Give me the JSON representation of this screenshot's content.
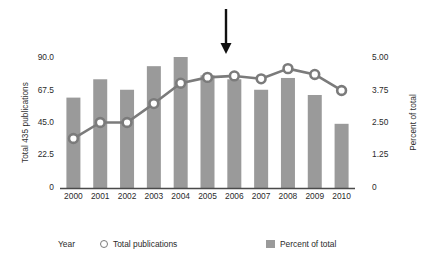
{
  "chart_data": {
    "type": "bar",
    "title": "",
    "subtitle": "",
    "xlabel": "Year",
    "categories": [
      "2000",
      "2001",
      "2002",
      "2003",
      "2004",
      "2005",
      "2006",
      "2007",
      "2008",
      "2009",
      "2010"
    ],
    "grid": false,
    "legend_position": "bottom",
    "axes": {
      "left": {
        "label": "Total 435 publications",
        "ticks": [
          "0",
          "22.5",
          "45.0",
          "67.5",
          "90.0"
        ],
        "tick_values": [
          0,
          22.5,
          45.0,
          67.5,
          90.0
        ],
        "ylim": [
          0,
          90
        ]
      },
      "right": {
        "label": "Percent of total",
        "ticks": [
          "0",
          "1.25",
          "2.50",
          "3.75",
          "5.00"
        ],
        "tick_values": [
          0,
          1.25,
          2.5,
          3.75,
          5.0
        ],
        "ylim": [
          0,
          5
        ]
      }
    },
    "series": [
      {
        "name": "Percent of total",
        "type": "bar",
        "axis": "right",
        "color": "#9a9a9a",
        "values": [
          3.45,
          4.15,
          3.75,
          4.65,
          5.0,
          4.3,
          4.15,
          3.75,
          4.2,
          3.55,
          2.45
        ]
      },
      {
        "name": "Total publications",
        "type": "line",
        "axis": "left",
        "color": "#7b7b7b",
        "marker": "circle-open",
        "values": [
          34,
          45,
          45,
          58,
          72,
          76,
          77,
          75,
          82,
          78,
          67
        ]
      }
    ],
    "annotations": [
      {
        "name": "down-arrow",
        "type": "arrow",
        "direction": "down",
        "at_x": "between 2005 and 2006",
        "color": "#111111"
      }
    ]
  },
  "legend": {
    "x_axis_title": "Year",
    "line_label": "Total publications",
    "bar_label": "Percent of total"
  }
}
